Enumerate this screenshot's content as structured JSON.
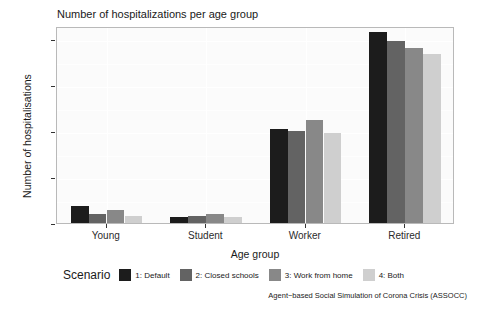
{
  "chart_data": {
    "type": "bar",
    "title": "Number of hospitalizations per age group",
    "xlabel": "Age group",
    "ylabel": "Number of hospitalisations",
    "categories": [
      "Young",
      "Student",
      "Worker",
      "Retired"
    ],
    "series": [
      {
        "name": "1: Default",
        "color": "#1c1c1c",
        "values": [
          9,
          3,
          51,
          104
        ]
      },
      {
        "name": "2: Closed schools",
        "color": "#636363",
        "values": [
          5,
          4,
          50,
          99
        ]
      },
      {
        "name": "3: Work from home",
        "color": "#888888",
        "values": [
          7,
          5,
          56,
          95
        ]
      },
      {
        "name": "4: Both",
        "color": "#cfcfcf",
        "values": [
          4,
          3,
          49,
          92
        ]
      }
    ],
    "ylim": [
      0,
      107
    ],
    "yticks": [
      0,
      25,
      50,
      75,
      100
    ],
    "ytick_labels": [
      "0",
      "25",
      "50",
      "75",
      "100"
    ],
    "yminor": [
      12.5,
      37.5,
      62.5,
      87.5
    ],
    "grid": true,
    "legend_position": "bottom",
    "legend_title": "Scenario",
    "caption": "Agent−based Social Simulation of Corona Crisis (ASSOCC)"
  }
}
